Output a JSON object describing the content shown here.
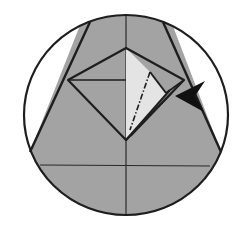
{
  "diagram": {
    "type": "origami-step",
    "colors": {
      "background": "#ffffff",
      "paper_gray": "#a3a3a3",
      "paper_light": "#e6e6e6",
      "outline": "#1e1e1e",
      "arrow": "#111111"
    },
    "elements": {
      "circle_frame": "circle-frame",
      "paper_shape": "trapezoid-paper",
      "diamond_flap": "diamond-flap",
      "light_flap": "light-triangular-flap",
      "valley_line": "dash-dot-fold-line",
      "push_arrow": "push-arrow"
    }
  }
}
